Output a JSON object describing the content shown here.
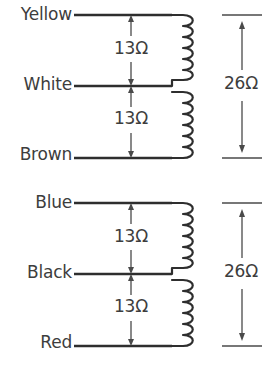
{
  "diagram": {
    "line_color": "#2e2e2e",
    "text_color": "#3d3d3d",
    "background_color": "#ffffff",
    "groups": [
      {
        "id": "coil-group-1",
        "leads": {
          "top": "Yellow",
          "mid": "White",
          "bottom": "Red-placeholder"
        },
        "lead_top": "Yellow",
        "lead_mid": "White",
        "lead_bottom": "Brown",
        "resistance_top": "13Ω",
        "resistance_bottom": "13Ω",
        "resistance_total": "26Ω"
      },
      {
        "id": "coil-group-2",
        "lead_top": "Blue",
        "lead_mid": "Black",
        "lead_bottom": "Red",
        "resistance_top": "13Ω",
        "resistance_bottom": "13Ω",
        "resistance_total": "26Ω"
      }
    ]
  }
}
